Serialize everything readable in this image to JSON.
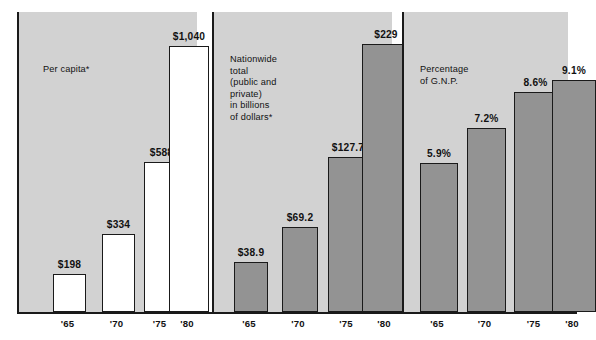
{
  "figure": {
    "background_color": "#ffffff",
    "panel_background_color": "#d2d2d2",
    "bar_outline_color": "#1a1a1a",
    "gray_bar_fill": "#939393",
    "white_bar_fill": "#ffffff"
  },
  "panels": [
    {
      "id": "per-capita",
      "caption": "Per capita*",
      "bar_style": "white",
      "bars": [
        {
          "tick": "'65",
          "label": "$198",
          "value": 198
        },
        {
          "tick": "'70",
          "label": "$334",
          "value": 334
        },
        {
          "tick": "'75",
          "label": "$588",
          "value": 588
        },
        {
          "tick": "'80",
          "label": "$1,040",
          "value": 1040
        }
      ]
    },
    {
      "id": "nationwide-total",
      "caption": "Nationwide\ntotal\n(public and\nprivate)\nin billions\nof dollars*",
      "bar_style": "gray",
      "bars": [
        {
          "tick": "'65",
          "label": "$38.9",
          "value": 38.9
        },
        {
          "tick": "'70",
          "label": "$69.2",
          "value": 69.2
        },
        {
          "tick": "'75",
          "label": "$127.7",
          "value": 127.7
        },
        {
          "tick": "'80",
          "label": "$229",
          "value": 229
        }
      ]
    },
    {
      "id": "percentage-of-gnp",
      "caption": "Percentage\nof G.N.P.",
      "bar_style": "gray",
      "bars": [
        {
          "tick": "'65",
          "label": "5.9%",
          "value": 5.9
        },
        {
          "tick": "'70",
          "label": "7.2%",
          "value": 7.2
        },
        {
          "tick": "'75",
          "label": "8.6%",
          "value": 8.6
        },
        {
          "tick": "'80",
          "label": "9.1%",
          "value": 9.1
        }
      ]
    }
  ],
  "chart_data": {
    "type": "bar",
    "title": "",
    "subtitle": "",
    "categories": [
      "'65",
      "'70",
      "'75",
      "'80"
    ],
    "xlabel": "",
    "ylabel": "",
    "grid": false,
    "legend_position": "none",
    "panels": [
      {
        "name": "Per capita*",
        "categories": [
          "'65",
          "'70",
          "'75",
          "'80"
        ],
        "values": [
          198,
          334,
          588,
          1040
        ],
        "data_labels": [
          "$198",
          "$334",
          "$588",
          "$1,040"
        ],
        "ylim": [
          0,
          1040
        ],
        "unit": "dollars"
      },
      {
        "name": "Nationwide total (public and private) in billions of dollars*",
        "categories": [
          "'65",
          "'70",
          "'75",
          "'80"
        ],
        "values": [
          38.9,
          69.2,
          127.7,
          229
        ],
        "data_labels": [
          "$38.9",
          "$69.2",
          "$127.7",
          "$229"
        ],
        "ylim": [
          0,
          229
        ],
        "unit": "billions of dollars"
      },
      {
        "name": "Percentage of G.N.P.",
        "categories": [
          "'65",
          "'70",
          "'75",
          "'80"
        ],
        "values": [
          5.9,
          7.2,
          8.6,
          9.1
        ],
        "data_labels": [
          "5.9%",
          "7.2%",
          "8.6%",
          "9.1%"
        ],
        "ylim": [
          0,
          9.1
        ],
        "unit": "percent"
      }
    ]
  }
}
